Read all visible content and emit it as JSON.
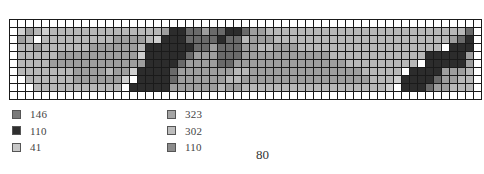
{
  "chart_data": {
    "type": "heatmap",
    "title": "",
    "columns": 59,
    "rows": 10,
    "palette": {
      "0": "#ffffff",
      "1": "#cfcfcf",
      "2": "#b8b8b8",
      "3": "#9e9e9e",
      "4": "#6a6a6a",
      "5": "#2c2c2c"
    },
    "grid": [
      "00000000000000000000000000000000000000000000000000000000000",
      "01321222222222222223554434455433222222222222222222222222240",
      "03202222222223333215554444544233322222222222222222222223450",
      "02232222223333332555555443444332233322222222222222222205550",
      "02222233333333331555554333444333333333332222222222225555530",
      "02222333333333333555543333443333333333333322222222205555530",
      "02222222333323315555433333332233333333333333222220555533320",
      "00222222333333105555433333322333333333333333322215555433220",
      "00022222222222055555333333233222222222222222222105554332220",
      "00000000000000000000000000000000000000000000000000000000000"
    ],
    "legend": [
      {
        "code": "146",
        "color": "#7a7a7a"
      },
      {
        "code": "110",
        "color": "#2e2e2e"
      },
      {
        "code": "41",
        "color": "#c8c8c8"
      },
      {
        "code": "323",
        "color": "#a4a4a4"
      },
      {
        "code": "302",
        "color": "#bdbdbd"
      },
      {
        "code": "110",
        "color": "#8c8c8c"
      }
    ]
  },
  "legend": {
    "left": [
      {
        "label": "146",
        "color": "#7a7a7a"
      },
      {
        "label": "110",
        "color": "#2e2e2e"
      },
      {
        "label": "41",
        "color": "#c8c8c8"
      }
    ],
    "right": [
      {
        "label": "323",
        "color": "#a4a4a4"
      },
      {
        "label": "302",
        "color": "#bdbdbd"
      },
      {
        "label": "110",
        "color": "#8c8c8c"
      }
    ]
  },
  "page": {
    "number": "80"
  }
}
